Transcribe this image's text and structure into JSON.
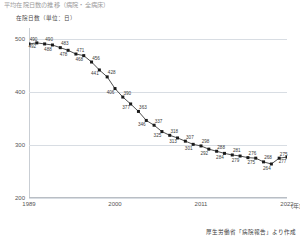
{
  "top_title": "平均在院日数の推移（病院・全病床）",
  "y_axis": {
    "label": "在院日数（単位：日）",
    "ticks": [
      500,
      400,
      300,
      200
    ],
    "min": 200,
    "max": 520
  },
  "x_axis": {
    "ticks": [
      "1989",
      "2000",
      "2011",
      "2022"
    ],
    "unit": "(年)",
    "min": 1989,
    "max": 2022
  },
  "source": "厚生労働省「病院報告」より作成",
  "colors": {
    "line": "#3b3b3b",
    "marker": "#1a1a1a",
    "grid": "#d8dde3",
    "axis": "#b9bec4",
    "text": "#3a3a3a"
  },
  "chart_data": {
    "type": "line",
    "title": "平均在院日数の推移（病院・全病床）",
    "xlabel": "(年)",
    "ylabel": "在院日数（単位：日）",
    "ylim": [
      200,
      520
    ],
    "xlim": [
      1989,
      2022
    ],
    "grid": true,
    "legend": false,
    "x": [
      1989,
      1990,
      1991,
      1992,
      1993,
      1994,
      1995,
      1996,
      1997,
      1998,
      1999,
      2000,
      2001,
      2002,
      2003,
      2004,
      2005,
      2006,
      2007,
      2008,
      2009,
      2010,
      2011,
      2012,
      2013,
      2014,
      2015,
      2016,
      2017,
      2018,
      2019,
      2020,
      2021,
      2022
    ],
    "values": [
      490,
      492,
      490,
      488,
      483,
      478,
      471,
      468,
      456,
      441,
      428,
      406,
      390,
      377,
      363,
      346,
      337,
      325,
      318,
      313,
      307,
      301,
      298,
      292,
      288,
      284,
      281,
      279,
      276,
      275,
      268,
      264,
      275,
      277
    ],
    "point_labels": [
      "490",
      "492",
      "490",
      "488",
      "483",
      "478",
      "471",
      "468",
      "456",
      "441",
      "428",
      "406",
      "390",
      "377",
      "363",
      "346",
      "337",
      "325",
      "318",
      "313",
      "307",
      "301",
      "298",
      "292",
      "288",
      "284",
      "281",
      "279",
      "276",
      "275",
      "268",
      "264",
      "275",
      "277"
    ]
  }
}
